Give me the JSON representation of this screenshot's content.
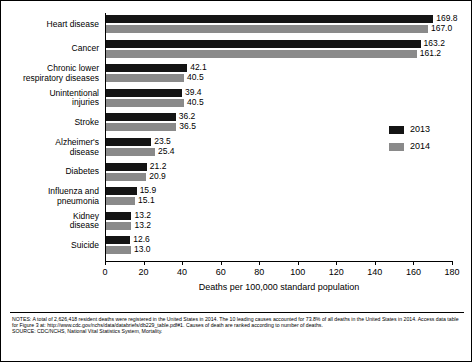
{
  "chart_data": {
    "type": "bar",
    "orientation": "horizontal",
    "title": "",
    "xlabel": "Deaths per 100,000 standard population",
    "ylabel": "",
    "xlim": [
      0,
      180
    ],
    "xticks": [
      0,
      20,
      40,
      60,
      80,
      100,
      120,
      140,
      160,
      180
    ],
    "grid": false,
    "legend_position": "right",
    "categories": [
      "Heart disease",
      "Cancer",
      "Chronic lower\nrespiratory diseases",
      "Unintentional\ninjuries",
      "Stroke",
      "Alzheimer's\ndisease",
      "Diabetes",
      "Influenza and\npneumonia",
      "Kidney\ndisease",
      "Suicide"
    ],
    "series": [
      {
        "name": "2013",
        "color": "#141414",
        "values": [
          169.8,
          163.2,
          42.1,
          39.4,
          36.2,
          23.5,
          21.2,
          15.9,
          13.2,
          12.6
        ],
        "labels": [
          "169.8",
          "163.2",
          "42.1",
          "39.4",
          "36.2",
          "23.5",
          "21.2",
          "15.9",
          "13.2",
          "12.6"
        ]
      },
      {
        "name": "2014",
        "color": "#8a8a8a",
        "values": [
          167.0,
          161.2,
          40.5,
          40.5,
          36.5,
          25.4,
          20.9,
          15.1,
          13.2,
          13.0
        ],
        "labels": [
          "167.0",
          "161.2",
          "40.5",
          "40.5",
          "36.5",
          "25.4",
          "20.9",
          "15.1",
          "13.2",
          "13.0"
        ]
      }
    ]
  },
  "legend": {
    "items": [
      {
        "label": "2013",
        "color": "#141414"
      },
      {
        "label": "2014",
        "color": "#8a8a8a"
      }
    ]
  },
  "footer": {
    "notes": "NOTES: A total of 2,626,418 resident deaths were registered in the United States in 2014. The 10 leading causes accounted for 73.8% of all deaths in the United States in 2014. Access data table for Figure 3 at: http://www.cdc.gov/nchs/data/databriefs/db229_table.pdf#1. Causes of death are ranked according to number of deaths.",
    "source": "SOURCE: CDC/NCHS, National Vital Statistics System, Mortality."
  }
}
